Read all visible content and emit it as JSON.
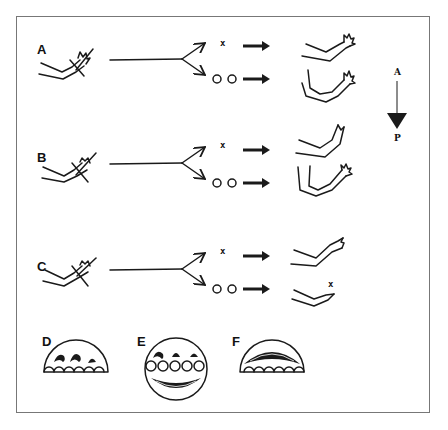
{
  "figure": {
    "rows": [
      {
        "label": "A",
        "upper_marker": "x",
        "lower_marker": "o o",
        "upper_result": "normal-limb",
        "lower_result": "duplicated-limb"
      },
      {
        "label": "B",
        "upper_marker": "x",
        "lower_marker": "o o",
        "upper_result": "truncated-limb",
        "lower_result": "duplicated-limb"
      },
      {
        "label": "C",
        "upper_marker": "x",
        "lower_marker": "o o",
        "upper_result": "normal-limb",
        "lower_result": "reduced-limb",
        "lower_result_marker": "x"
      }
    ],
    "axis": {
      "top": "A",
      "bottom": "P"
    },
    "cross_sections": [
      {
        "label": "D"
      },
      {
        "label": "E"
      },
      {
        "label": "F"
      }
    ]
  }
}
